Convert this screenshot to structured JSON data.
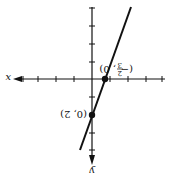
{
  "figure": {
    "rotation_deg": 180,
    "axis_labels": {
      "x": "x",
      "y": "y"
    },
    "points": [
      {
        "label": "(0, 2)",
        "x": 0,
        "y": 2
      },
      {
        "label": "(−2/3, 0)",
        "label_num": "2",
        "label_den": "3",
        "x": -0.6667,
        "y": 0
      }
    ],
    "line": {
      "equation": "y = 3x + 2",
      "slope": 3,
      "intercept": 2
    },
    "colors": {
      "ink": "#111111",
      "background": "#ffffff"
    }
  },
  "labels": {
    "point_a": "(0, 2)",
    "point_b_open": "(−",
    "point_b_num": "2",
    "point_b_den": "3",
    "point_b_close": ", 0)",
    "x_axis": "x",
    "y_axis": "y"
  }
}
